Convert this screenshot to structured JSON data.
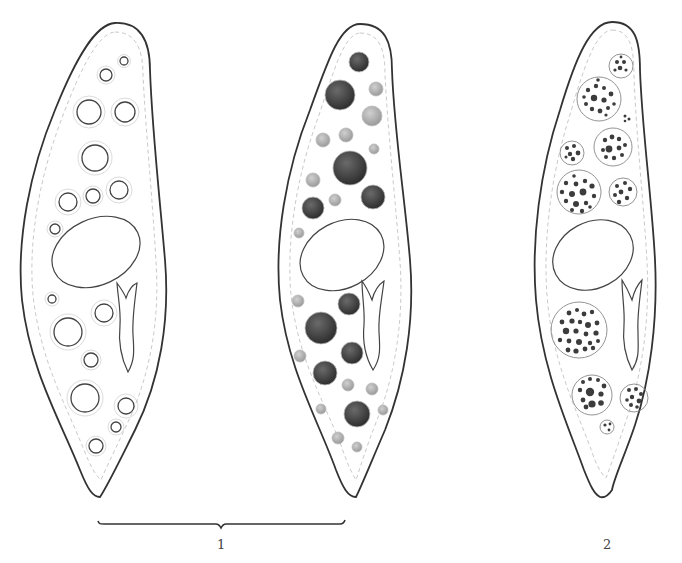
{
  "figure": {
    "labels": {
      "fig1": "1",
      "fig2": "2"
    },
    "panels": [
      {
        "id": "cell-a",
        "group": "1",
        "vacuole_style": "empty rings"
      },
      {
        "id": "cell-b",
        "group": "1",
        "vacuole_style": "dark filled granules"
      },
      {
        "id": "cell-c",
        "group": "2",
        "vacuole_style": "dotted clusters"
      }
    ],
    "colors": {
      "outline": "#333333",
      "inner_dashed": "#bbbbbb",
      "filled_dark": "#3a3a3a",
      "filled_light": "#9a9a9a",
      "dot": "#3c3c3c"
    }
  }
}
